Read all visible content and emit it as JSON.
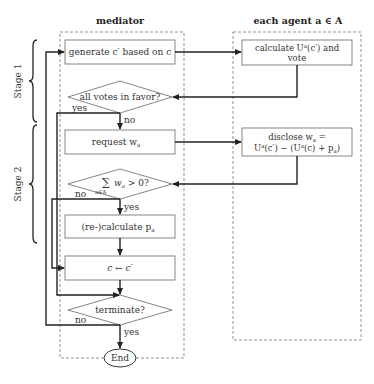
{
  "headers": {
    "mediator": "mediator",
    "agent": "each agent a ∈ A"
  },
  "stages": {
    "stage1": "Stage 1",
    "stage2": "Stage 2"
  },
  "mediator_nodes": {
    "generate": "generate c′ based on c",
    "all_votes": "all votes in favor?",
    "request": "request w",
    "request_sub": "a",
    "sum_condition": "w",
    "sum_sub": "a",
    "sum_rest": " > 0?",
    "sum_symbol": "∑",
    "sum_index": "a∈A",
    "recalculate": "(re-)calculate p",
    "recalculate_sub": "a",
    "assign": "c ← c′",
    "terminate": "terminate?",
    "end": "End"
  },
  "agent_nodes": {
    "calculate_line1": "calculate U",
    "calculate_sup": "a",
    "calculate_line1_rest": "(c′) and",
    "calculate_line2": "vote",
    "disclose_line1": "disclose w",
    "disclose_sub": "a",
    "disclose_eq": " =",
    "disclose_line2": "U",
    "disclose_line2_sup": "a",
    "disclose_line2_rest": "(c′) − (U",
    "disclose_line2_sup2": "a",
    "disclose_line2_rest2": "(c) + p",
    "disclose_line2_sub": "a",
    "disclose_line2_close": ")"
  },
  "edge_labels": {
    "votes_yes": "yes",
    "votes_no": "no",
    "sum_no": "no",
    "sum_yes": "yes",
    "terminate_no": "no",
    "terminate_yes": "yes"
  },
  "colors": {
    "line": "#222222",
    "box_border": "#666666",
    "dashed": "#777777"
  }
}
